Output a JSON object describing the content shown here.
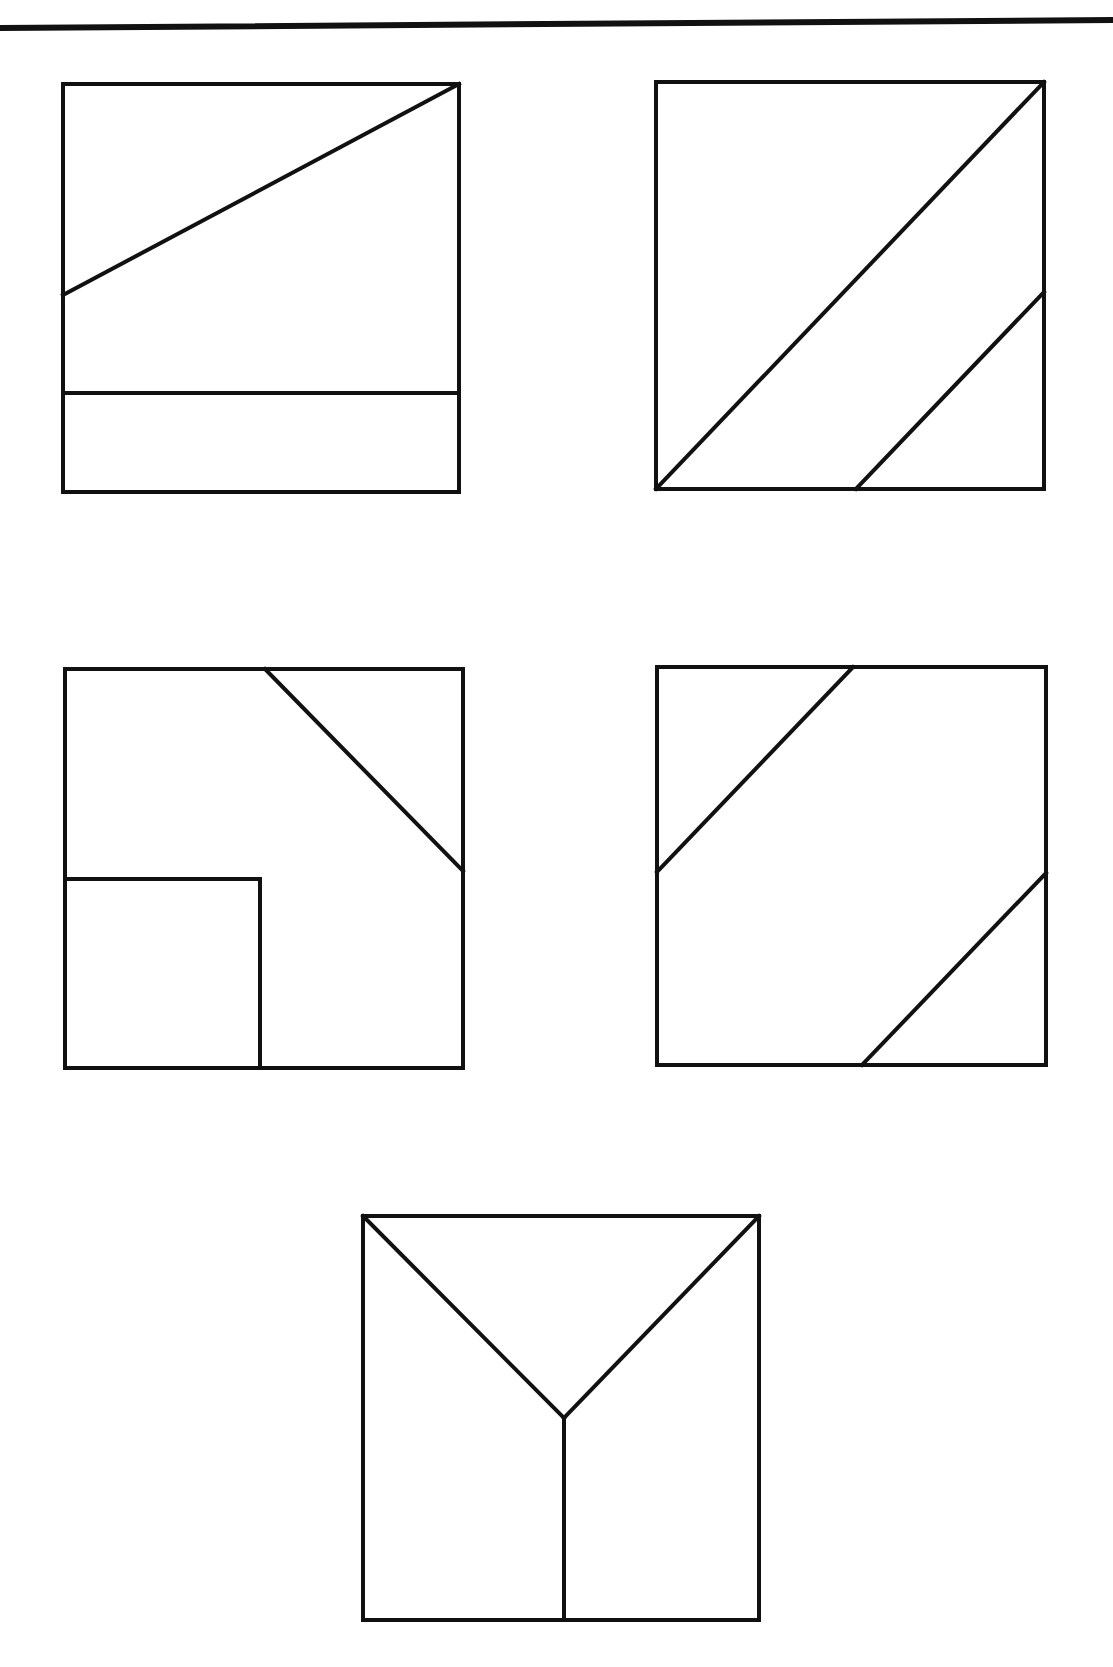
{
  "page": {
    "width": 1113,
    "height": 1667,
    "background": "#ffffff",
    "stroke_color": "#111111",
    "stroke_width": 4
  },
  "top_rule": {
    "x1": 0,
    "y1": 28,
    "x2": 1113,
    "y2": 20,
    "thickness": 6
  },
  "figures": [
    {
      "id": "figure-1",
      "description": "Square with diagonal from left edge to top-right corner and horizontal strip at bottom",
      "frame": {
        "x1": 63,
        "y1": 84,
        "x2": 459,
        "y2": 492
      },
      "lines": [
        {
          "x1": 63,
          "y1": 295,
          "x2": 459,
          "y2": 84
        },
        {
          "x1": 63,
          "y1": 393,
          "x2": 459,
          "y2": 393
        }
      ]
    },
    {
      "id": "figure-2",
      "description": "Square with main diagonal bottom-left to top-right and a parallel diagonal in lower-right",
      "frame": {
        "x1": 656,
        "y1": 82,
        "x2": 1044,
        "y2": 489
      },
      "lines": [
        {
          "x1": 656,
          "y1": 489,
          "x2": 1044,
          "y2": 82
        },
        {
          "x1": 856,
          "y1": 489,
          "x2": 1044,
          "y2": 292
        }
      ]
    },
    {
      "id": "figure-3",
      "description": "Square with diagonal cutting top-right corner and inner square at bottom-left",
      "frame": {
        "x1": 65,
        "y1": 669,
        "x2": 463,
        "y2": 1068
      },
      "lines": [
        {
          "x1": 265,
          "y1": 669,
          "x2": 463,
          "y2": 871
        },
        {
          "x1": 65,
          "y1": 879,
          "x2": 260,
          "y2": 879
        },
        {
          "x1": 260,
          "y1": 879,
          "x2": 260,
          "y2": 1068
        }
      ]
    },
    {
      "id": "figure-4",
      "description": "Square with two parallel diagonals cutting top-left and bottom-right corners",
      "frame": {
        "x1": 657,
        "y1": 667,
        "x2": 1046,
        "y2": 1065
      },
      "lines": [
        {
          "x1": 853,
          "y1": 667,
          "x2": 657,
          "y2": 872
        },
        {
          "x1": 1046,
          "y1": 873,
          "x2": 862,
          "y2": 1065
        }
      ]
    },
    {
      "id": "figure-5",
      "description": "Square with Y shape: diagonals from top corners meeting at center, vertical line to bottom",
      "frame": {
        "x1": 363,
        "y1": 1216,
        "x2": 759,
        "y2": 1620
      },
      "lines": [
        {
          "x1": 363,
          "y1": 1216,
          "x2": 564,
          "y2": 1418
        },
        {
          "x1": 759,
          "y1": 1216,
          "x2": 564,
          "y2": 1418
        },
        {
          "x1": 564,
          "y1": 1418,
          "x2": 564,
          "y2": 1620
        }
      ]
    }
  ]
}
